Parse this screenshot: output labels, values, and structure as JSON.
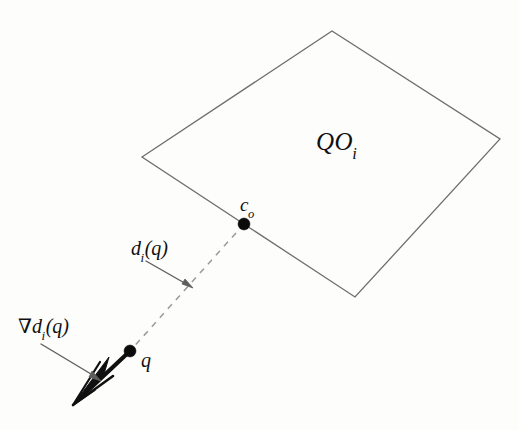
{
  "figure": {
    "background_color": "#fdfdfc",
    "ink_color": "#101010",
    "outline_color": "#6e6e6e",
    "dash_color": "#9a9a9a",
    "annotation_arrow_color": "#5e5e5e",
    "width": 519,
    "height": 430
  },
  "labels": {
    "obstacle": {
      "base": "QO",
      "sub": "i",
      "full": "QO_i"
    },
    "contact_point": {
      "base": "c",
      "sub": "o",
      "full": "c_o"
    },
    "distance": {
      "prefix": "",
      "base": "d",
      "sub": "i",
      "suffix": "(q)",
      "full": "d_i(q)"
    },
    "gradient": {
      "prefix": "∇",
      "base": "d",
      "sub": "i",
      "suffix": "(q)",
      "full": "∇d_i(q)"
    },
    "query_point": {
      "base": "q",
      "sub": "",
      "full": "q"
    }
  },
  "geometry": {
    "obstacle_polygon": [
      {
        "x": 142,
        "y": 157
      },
      {
        "x": 332,
        "y": 31
      },
      {
        "x": 500,
        "y": 139
      },
      {
        "x": 355,
        "y": 297
      }
    ],
    "points": [
      {
        "name": "c_o",
        "x": 244,
        "y": 224,
        "radius": 6
      },
      {
        "name": "q",
        "x": 130,
        "y": 351,
        "radius": 6
      }
    ],
    "distance_segment": {
      "x1": 244,
      "y1": 224,
      "x2": 130,
      "y2": 351,
      "style": "dashed"
    },
    "gradient_vector": {
      "x1": 130,
      "y1": 351,
      "x2": 73,
      "y2": 404,
      "style": "thick-arrow"
    },
    "annotation_arrows": [
      {
        "name": "d_i(q)-pointer",
        "x1": 146,
        "y1": 263,
        "x2": 192,
        "y2": 288
      },
      {
        "name": "grad-d_i(q)-pointer",
        "x1": 40,
        "y1": 343,
        "x2": 100,
        "y2": 380
      }
    ]
  }
}
